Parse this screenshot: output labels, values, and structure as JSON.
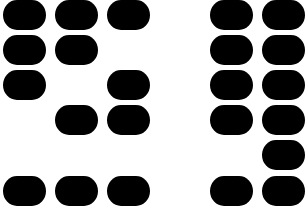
{
  "colors": {
    "block": "#000000",
    "background": "#ffffff"
  },
  "glyphs": [
    {
      "name": "left-glyph",
      "grid": [
        [
          1,
          1,
          1
        ],
        [
          1,
          1,
          0
        ],
        [
          1,
          0,
          1
        ],
        [
          0,
          1,
          1
        ],
        [
          0,
          0,
          0
        ],
        [
          1,
          1,
          1
        ]
      ]
    },
    {
      "name": "right-glyph",
      "grid": [
        [
          1,
          1
        ],
        [
          1,
          1
        ],
        [
          1,
          1
        ],
        [
          1,
          1
        ],
        [
          0,
          1
        ],
        [
          1,
          1
        ]
      ]
    }
  ]
}
